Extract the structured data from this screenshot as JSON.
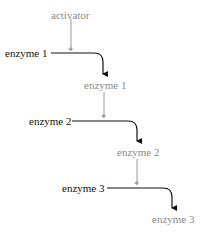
{
  "diagram": {
    "type": "enzyme activation cascade",
    "activator": {
      "label": "activator",
      "color": "#8a8a8a"
    },
    "steps": [
      {
        "enzyme": "enzyme 1",
        "product": "enzyme 1"
      },
      {
        "enzyme": "enzyme 2",
        "product": "enzyme 2"
      },
      {
        "enzyme": "enzyme 3",
        "product": "enzyme 3"
      }
    ],
    "catalysis_marker": "*",
    "colors": {
      "inactive": "#111111",
      "active": "#8a8a8a"
    }
  }
}
